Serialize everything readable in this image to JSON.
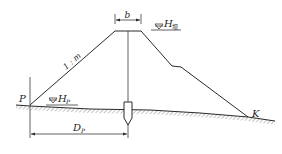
{
  "diagram": {
    "labels": {
      "crest_width": "b",
      "slope_ratio": "1 : m",
      "dam_water_level_main": "H",
      "dam_water_level_sub": "坝",
      "point_p": "P",
      "water_level_p_main": "H",
      "water_level_p_sub": "P",
      "point_k": "K",
      "distance_main": "D",
      "distance_sub": "P"
    },
    "colors": {
      "line": "#2a2a2a",
      "hatch": "#8a8a8a",
      "background": "#ffffff"
    }
  }
}
